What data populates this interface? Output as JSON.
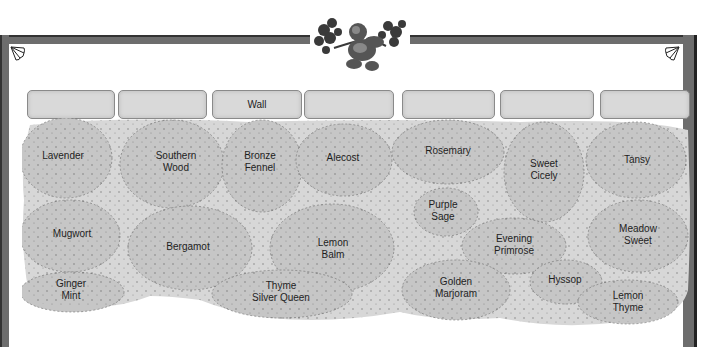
{
  "frame": {
    "border_color": "#6d6d6d",
    "border_dark": "#333333"
  },
  "ornament": {
    "icon": "cherub-with-branches-icon"
  },
  "corners": {
    "left_icon": "leaf-corner-icon",
    "right_icon": "leaf-corner-icon"
  },
  "wall": {
    "label": "Wall",
    "bricks": [
      {
        "x": 27,
        "w": 86,
        "label": ""
      },
      {
        "x": 118,
        "w": 87,
        "label": ""
      },
      {
        "x": 212,
        "w": 88,
        "label": "Wall"
      },
      {
        "x": 304,
        "w": 88,
        "label": ""
      },
      {
        "x": 402,
        "w": 91,
        "label": ""
      },
      {
        "x": 500,
        "w": 92,
        "label": ""
      },
      {
        "x": 600,
        "w": 88,
        "label": ""
      }
    ]
  },
  "plants": [
    {
      "name": "Lavender",
      "x": 63,
      "y": 156
    },
    {
      "name": "Southern\nWood",
      "x": 176,
      "y": 162
    },
    {
      "name": "Bronze\nFennel",
      "x": 260,
      "y": 162
    },
    {
      "name": "Alecost",
      "x": 343,
      "y": 158
    },
    {
      "name": "Rosemary",
      "x": 448,
      "y": 151
    },
    {
      "name": "Sweet\nCicely",
      "x": 544,
      "y": 170
    },
    {
      "name": "Tansy",
      "x": 637,
      "y": 160
    },
    {
      "name": "Purple\nSage",
      "x": 443,
      "y": 211
    },
    {
      "name": "Mugwort",
      "x": 72,
      "y": 234
    },
    {
      "name": "Bergamot",
      "x": 188,
      "y": 247
    },
    {
      "name": "Lemon\nBalm",
      "x": 333,
      "y": 249
    },
    {
      "name": "Evening\nPrimrose",
      "x": 514,
      "y": 245
    },
    {
      "name": "Meadow\nSweet",
      "x": 638,
      "y": 235
    },
    {
      "name": "Ginger\nMint",
      "x": 71,
      "y": 290
    },
    {
      "name": "Thyme\nSilver Queen",
      "x": 281,
      "y": 292
    },
    {
      "name": "Golden\nMarjoram",
      "x": 456,
      "y": 288
    },
    {
      "name": "Hyssop",
      "x": 565,
      "y": 280
    },
    {
      "name": "Lemon\nThyme",
      "x": 628,
      "y": 302
    }
  ]
}
